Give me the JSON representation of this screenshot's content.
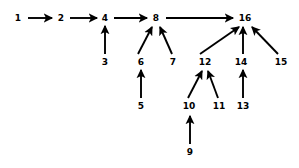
{
  "diagram": {
    "type": "directed-graph",
    "canvas": {
      "width": 299,
      "height": 168
    },
    "stroke_color": "#000000",
    "background_color": "#ffffff",
    "nodes": [
      {
        "id": "n1",
        "label": "1",
        "x": 18,
        "y": 18
      },
      {
        "id": "n2",
        "label": "2",
        "x": 61,
        "y": 18
      },
      {
        "id": "n3",
        "label": "3",
        "x": 105,
        "y": 62
      },
      {
        "id": "n4",
        "label": "4",
        "x": 105,
        "y": 18
      },
      {
        "id": "n5",
        "label": "5",
        "x": 141,
        "y": 106
      },
      {
        "id": "n6",
        "label": "6",
        "x": 141,
        "y": 62
      },
      {
        "id": "n7",
        "label": "7",
        "x": 173,
        "y": 62
      },
      {
        "id": "n8",
        "label": "8",
        "x": 156,
        "y": 18
      },
      {
        "id": "n9",
        "label": "9",
        "x": 190,
        "y": 152
      },
      {
        "id": "n10",
        "label": "10",
        "x": 189,
        "y": 106
      },
      {
        "id": "n11",
        "label": "11",
        "x": 219,
        "y": 106
      },
      {
        "id": "n12",
        "label": "12",
        "x": 205,
        "y": 62
      },
      {
        "id": "n13",
        "label": "13",
        "x": 243,
        "y": 106
      },
      {
        "id": "n14",
        "label": "14",
        "x": 241,
        "y": 62
      },
      {
        "id": "n15",
        "label": "15",
        "x": 281,
        "y": 62
      },
      {
        "id": "n16",
        "label": "16",
        "x": 245,
        "y": 18
      }
    ],
    "edges": [
      {
        "id": "e1",
        "from": "1",
        "to": "2",
        "direction": "right",
        "x1": 28,
        "y1": 18,
        "x2": 52,
        "y2": 18
      },
      {
        "id": "e2",
        "from": "2",
        "to": "4",
        "direction": "right",
        "x1": 70,
        "y1": 18,
        "x2": 97,
        "y2": 18
      },
      {
        "id": "e3",
        "from": "4",
        "to": "8",
        "direction": "right",
        "x1": 114,
        "y1": 18,
        "x2": 147,
        "y2": 18
      },
      {
        "id": "e4",
        "from": "8",
        "to": "16",
        "direction": "right",
        "x1": 166,
        "y1": 18,
        "x2": 233,
        "y2": 18
      },
      {
        "id": "e5",
        "from": "3",
        "to": "4",
        "direction": "up",
        "x1": 105,
        "y1": 54,
        "x2": 105,
        "y2": 26
      },
      {
        "id": "e6",
        "from": "6",
        "to": "8",
        "direction": "up-right",
        "x1": 138,
        "y1": 54,
        "x2": 152,
        "y2": 27
      },
      {
        "id": "e7",
        "from": "7",
        "to": "8",
        "direction": "up-left",
        "x1": 172,
        "y1": 54,
        "x2": 160,
        "y2": 27
      },
      {
        "id": "e8",
        "from": "5",
        "to": "6",
        "direction": "up",
        "x1": 141,
        "y1": 98,
        "x2": 141,
        "y2": 70
      },
      {
        "id": "e9",
        "from": "12",
        "to": "16",
        "direction": "up-right",
        "x1": 200,
        "y1": 54,
        "x2": 239,
        "y2": 27
      },
      {
        "id": "e10",
        "from": "14",
        "to": "16",
        "direction": "up",
        "x1": 243,
        "y1": 54,
        "x2": 243,
        "y2": 27
      },
      {
        "id": "e11",
        "from": "15",
        "to": "16",
        "direction": "up-left",
        "x1": 278,
        "y1": 54,
        "x2": 252,
        "y2": 27
      },
      {
        "id": "e12",
        "from": "10",
        "to": "12",
        "direction": "up-right",
        "x1": 188,
        "y1": 98,
        "x2": 202,
        "y2": 71
      },
      {
        "id": "e13",
        "from": "11",
        "to": "12",
        "direction": "up-left",
        "x1": 218,
        "y1": 98,
        "x2": 208,
        "y2": 71
      },
      {
        "id": "e14",
        "from": "13",
        "to": "14",
        "direction": "up",
        "x1": 243,
        "y1": 98,
        "x2": 243,
        "y2": 70
      },
      {
        "id": "e15",
        "from": "9",
        "to": "10",
        "direction": "up",
        "x1": 190,
        "y1": 144,
        "x2": 190,
        "y2": 116
      }
    ]
  }
}
